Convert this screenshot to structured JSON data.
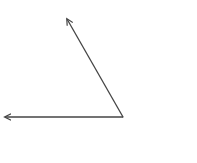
{
  "diagram": {
    "type": "angle",
    "background": "#ffffff",
    "stroke_color": "#444444",
    "stroke_width": 1.3,
    "vertex": {
      "x": 123,
      "y": 117
    },
    "rays": [
      {
        "name": "upper-ray",
        "end": {
          "x": 67,
          "y": 19
        }
      },
      {
        "name": "horizontal-ray",
        "end": {
          "x": 5,
          "y": 117
        }
      }
    ],
    "labels": []
  }
}
